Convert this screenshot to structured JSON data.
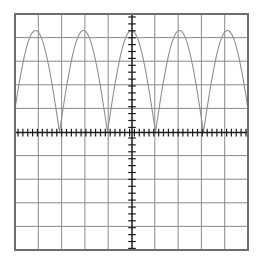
{
  "view": {
    "title": "Graphing calculator plot window",
    "background_color": "#ffffff",
    "border_color": "#6e6e6e",
    "grid_color": "#8a8a8a",
    "axis_color": "#1c1c1c",
    "curve_color": "#8f8f8f",
    "plot_box": {
      "left": 15,
      "top": 14,
      "right": 248,
      "bottom": 250
    }
  },
  "chart_data": {
    "type": "line",
    "title": "",
    "subtitle": "",
    "xlabel": "",
    "ylabel": "",
    "function_label": "rectified cosine (absolute value of cosine)",
    "grid": true,
    "grid_columns": 10,
    "grid_rows": 10,
    "legend": "none",
    "xlim": [
      -5,
      5
    ],
    "ylim": [
      -5,
      5
    ],
    "xticks": [
      -5,
      -4,
      -3,
      -2,
      -1,
      0,
      1,
      2,
      3,
      4,
      5
    ],
    "yticks": [
      -5,
      -4,
      -3,
      -2,
      -1,
      0,
      1,
      2,
      3,
      4,
      5
    ],
    "x_tick_labels": [],
    "y_tick_labels": [],
    "minor_tick_count_x": 48,
    "minor_tick_count_y": 34,
    "axis_origin": {
      "x": 0,
      "y": 0
    },
    "series": [
      {
        "name": "y = |cos(pi*x/2)|*4",
        "amplitude": 4.3,
        "period": 2.06,
        "phase_peak_at_x": 0,
        "baseline": 0,
        "peaks_x": [
          -4.12,
          -2.06,
          0,
          2.06,
          4.12
        ],
        "peaks_y": [
          4.3,
          4.3,
          4.3,
          4.3,
          4.3
        ],
        "zeros_x": [
          -3.09,
          -1.03,
          1.03,
          3.09
        ],
        "zeros_y": [
          0,
          0,
          0,
          0
        ],
        "x": [
          -5.0,
          -4.8,
          -4.6,
          -4.4,
          -4.2,
          -4.0,
          -3.8,
          -3.6,
          -3.4,
          -3.2,
          -3.0,
          -2.8,
          -2.6,
          -2.4,
          -2.2,
          -2.0,
          -1.8,
          -1.6,
          -1.4,
          -1.2,
          -1.0,
          -0.8,
          -0.6,
          -0.4,
          -0.2,
          0.0,
          0.2,
          0.4,
          0.6,
          0.8,
          1.0,
          1.2,
          1.4,
          1.6,
          1.8,
          2.0,
          2.2,
          2.4,
          2.6,
          2.8,
          3.0,
          3.2,
          3.4,
          3.6,
          3.8,
          4.0,
          4.2,
          4.4,
          4.6,
          4.8,
          5.0
        ],
        "y": [
          0.42,
          1.62,
          2.82,
          3.73,
          4.22,
          4.25,
          3.81,
          2.95,
          1.79,
          0.52,
          0.21,
          1.43,
          2.68,
          3.65,
          4.2,
          4.27,
          3.88,
          3.07,
          1.95,
          0.7,
          0.02,
          1.23,
          2.52,
          3.55,
          4.16,
          4.3,
          4.16,
          3.55,
          2.52,
          1.23,
          0.02,
          0.7,
          1.95,
          3.07,
          3.88,
          4.27,
          4.2,
          3.65,
          2.68,
          1.43,
          0.21,
          0.52,
          1.79,
          2.95,
          3.81,
          4.25,
          4.22,
          3.73,
          2.82,
          1.62,
          0.42
        ]
      }
    ]
  }
}
